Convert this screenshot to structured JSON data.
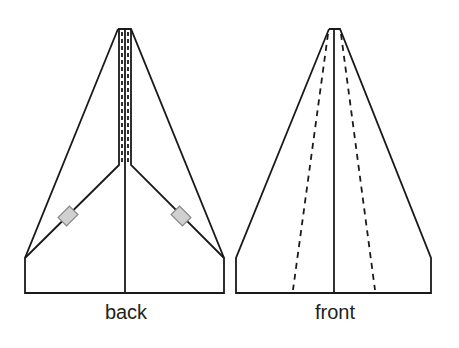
{
  "diagram": {
    "views": [
      {
        "id": "back",
        "label": "back"
      },
      {
        "id": "front",
        "label": "front"
      }
    ],
    "colors": {
      "line": "#1a1a1a",
      "tab_fill": "#d0d0d0",
      "tab_stroke": "#888888"
    }
  }
}
